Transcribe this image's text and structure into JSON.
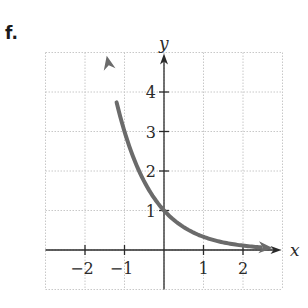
{
  "panel_label": "f.",
  "colors": {
    "curve": "#6b6b6b",
    "axis": "#2a2a2a",
    "grid": "#c8c8c8",
    "background": "#ffffff"
  },
  "chart_data": {
    "type": "line",
    "title": "",
    "function": "y = (1/3)^x",
    "xlabel": "x",
    "ylabel": "y",
    "xlim": [
      -3,
      3
    ],
    "ylim": [
      -1,
      5
    ],
    "grid": true,
    "grid_style": "dotted",
    "x_ticks": [
      -2,
      -1,
      1,
      2
    ],
    "x_tick_labels": [
      "−2",
      "−1",
      "1",
      "2"
    ],
    "y_ticks": [
      1,
      2,
      3,
      4
    ],
    "y_tick_labels": [
      "1",
      "2",
      "3",
      "4"
    ],
    "series": [
      {
        "name": "curve",
        "arrows": "both ends",
        "points": [
          {
            "x": -1.45,
            "y": 4.92
          },
          {
            "x": -1.0,
            "y": 3.0
          },
          {
            "x": -0.63,
            "y": 2.0
          },
          {
            "x": 0.0,
            "y": 1.0
          },
          {
            "x": 1.0,
            "y": 0.333
          },
          {
            "x": 2.0,
            "y": 0.111
          },
          {
            "x": 2.7,
            "y": 0.05
          }
        ]
      }
    ]
  }
}
